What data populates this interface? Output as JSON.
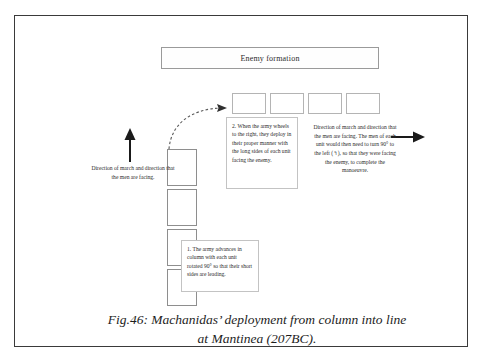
{
  "figure": {
    "caption_line_1": "Fig.46: Machanidas’ deployment from column into line",
    "caption_line_2": "at Mantinea (207BC)."
  },
  "enemy": {
    "label": "Enemy formation"
  },
  "deployed_line": {
    "unit_count": 4,
    "units": [
      {
        "id": "deployed-unit-1"
      },
      {
        "id": "deployed-unit-2"
      },
      {
        "id": "deployed-unit-3"
      },
      {
        "id": "deployed-unit-4"
      }
    ]
  },
  "marching_column": {
    "unit_count": 4,
    "units": [
      {
        "id": "column-unit-1"
      },
      {
        "id": "column-unit-2"
      },
      {
        "id": "column-unit-3"
      },
      {
        "id": "column-unit-4"
      }
    ]
  },
  "notes": {
    "note_one": "1. The army advances in column with each unit rotated 90° so that their short sides are leading.",
    "note_two": "2. When the army wheels to the right, they deploy in their proper manner with the long sides of each unit facing the enemy."
  },
  "labels": {
    "left_direction": "Direction of march and direction that the men are facing.",
    "right_direction": "Direction of march and direction that the men are facing. The men of each unit would then need to turn 90° to the left (↰), so that they were facing the enemy, to complete the manoeuvre."
  },
  "icons": {
    "up_arrow": "arrow-up-icon",
    "right_arrow": "arrow-right-icon",
    "wheel_arrow": "curved-dashed-arrow-icon"
  },
  "colors": {
    "frame_border": "#3a3a3a",
    "unit_border": "#8e8e8e",
    "note_border": "#c3c3c3",
    "text": "#2b2b2b",
    "arrow": "#1a1a1a"
  }
}
